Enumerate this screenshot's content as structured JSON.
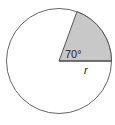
{
  "diagram": {
    "type": "circle-sector",
    "angle_label": "70°",
    "radius_label": "r",
    "angle_degrees": 70,
    "colors": {
      "sector_fill": "#c8c8c8",
      "outline": "#555555",
      "background": "#ffffff"
    }
  }
}
